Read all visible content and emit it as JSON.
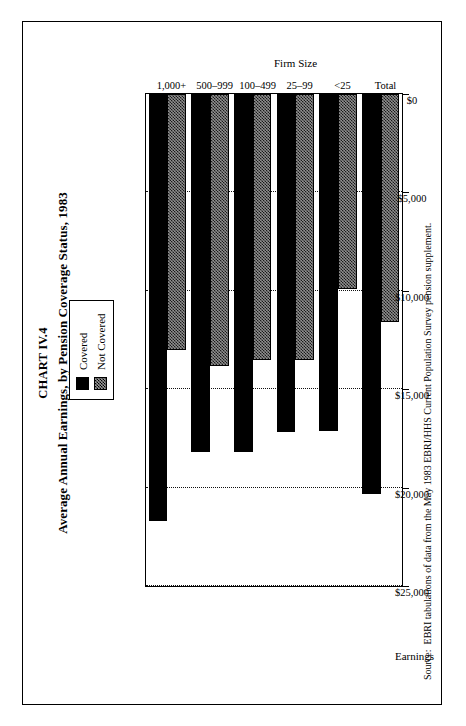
{
  "figure": {
    "chart_number": "CHART IV.4",
    "title": "Average Annual Earnings, by Pension Coverage Status, 1983",
    "source_label": "Source:",
    "source_text": "EBRI tabulations of data from the May 1983 EBRI/HHS Current Population Survey pension supplement."
  },
  "legend": {
    "items": [
      {
        "label": "Covered",
        "swatch": "solid-black-swatch",
        "color": "#000000"
      },
      {
        "label": "Not Covered",
        "swatch": "gray-hatch-swatch",
        "color": "#8f8f8f"
      }
    ]
  },
  "axes": {
    "value_axis_title": "Earnings",
    "category_axis_title": "Firm Size",
    "value_ticks": [
      "$25,000",
      "$20,000",
      "$15,000",
      "$10,000",
      "$5,000",
      "$0"
    ]
  },
  "chart_data": {
    "type": "bar",
    "orientation": "horizontal",
    "title": "Average Annual Earnings, by Pension Coverage Status, 1983",
    "subtitle": "CHART IV.4",
    "xlabel": "Firm Size",
    "ylabel": "Earnings",
    "ylim": [
      0,
      25000
    ],
    "ytick_values": [
      25000,
      20000,
      15000,
      10000,
      5000,
      0
    ],
    "ytick_labels": [
      "$25,000",
      "$20,000",
      "$15,000",
      "$10,000",
      "$5,000",
      "$0"
    ],
    "grid": true,
    "legend_position": "top-right",
    "categories": [
      "Total",
      "<25",
      "25–99",
      "100–499",
      "500–999",
      "1,000+"
    ],
    "series": [
      {
        "name": "Covered",
        "color": "#000000",
        "values": [
          20300,
          17100,
          17200,
          18200,
          18200,
          21700
        ]
      },
      {
        "name": "Not Covered",
        "color": "#8f8f8f",
        "values": [
          11600,
          9900,
          13500,
          13500,
          13800,
          13000
        ]
      }
    ]
  }
}
